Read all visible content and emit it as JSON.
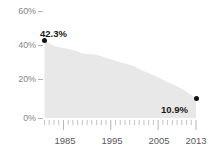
{
  "chart_data": {
    "type": "area",
    "title": "",
    "xlabel": "",
    "ylabel": "",
    "ylim": [
      0,
      65
    ],
    "xlim": [
      1981,
      2013
    ],
    "grid": false,
    "legend": null,
    "y_ticks": [
      "0%",
      "20%",
      "40%",
      "60%"
    ],
    "y_tick_values": [
      0,
      20,
      40,
      60
    ],
    "x_ticks": [
      "1985",
      "1995",
      "2005",
      "2013"
    ],
    "x_tick_values": [
      1985,
      1995,
      2005,
      2013
    ],
    "annotations": [
      {
        "name": "start-value",
        "label": "42.3%",
        "x": 1981,
        "y": 42.3
      },
      {
        "name": "end-value",
        "label": "10.9%",
        "x": 2013,
        "y": 10.9
      }
    ],
    "x": [
      1981,
      1982,
      1983,
      1984,
      1985,
      1986,
      1987,
      1988,
      1989,
      1990,
      1991,
      1992,
      1993,
      1994,
      1995,
      1996,
      1997,
      1998,
      1999,
      2000,
      2001,
      2002,
      2003,
      2004,
      2005,
      2006,
      2007,
      2008,
      2009,
      2010,
      2011,
      2012,
      2013
    ],
    "values": [
      42.3,
      41.0,
      39.6,
      38.9,
      38.4,
      37.8,
      37.2,
      36.6,
      35.4,
      35.2,
      35.0,
      34.6,
      33.8,
      33.0,
      32.2,
      31.4,
      30.6,
      29.8,
      29.0,
      28.2,
      27.0,
      25.6,
      24.6,
      23.6,
      22.3,
      21.0,
      19.6,
      18.6,
      17.4,
      16.0,
      14.4,
      12.6,
      10.9
    ]
  },
  "axis": {
    "y_labels": [
      {
        "text": "60%",
        "top": 6
      },
      {
        "text": "40%",
        "top": 40
      },
      {
        "text": "20%",
        "top": 74
      },
      {
        "text": "0%",
        "top": 113
      }
    ],
    "x_labels": [
      {
        "text": "1985",
        "left": 52
      },
      {
        "text": "1995",
        "left": 99
      },
      {
        "text": "2005",
        "left": 146
      },
      {
        "text": "2013",
        "left": 183
      }
    ]
  },
  "colors": {
    "area_fill": "#e8e8e8",
    "marker": "#111111",
    "tick": "#b4b4b4",
    "axis_text": "#868686",
    "year_text": "#5a5a5a",
    "label_text": "#1a1a1a",
    "background": "#ffffff"
  }
}
